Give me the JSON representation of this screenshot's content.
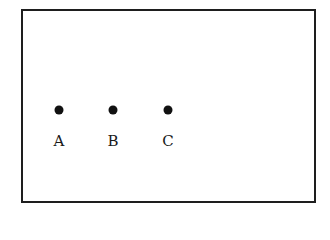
{
  "diagram": {
    "frame": {
      "border_color": "#1e1e1e"
    },
    "points": [
      {
        "label": "A",
        "dot_x": 59,
        "dot_y": 110,
        "label_y": 134
      },
      {
        "label": "B",
        "dot_x": 113,
        "dot_y": 110,
        "label_y": 134
      },
      {
        "label": "C",
        "dot_x": 168,
        "dot_y": 110,
        "label_y": 134
      }
    ],
    "dot_color": "#111111"
  }
}
